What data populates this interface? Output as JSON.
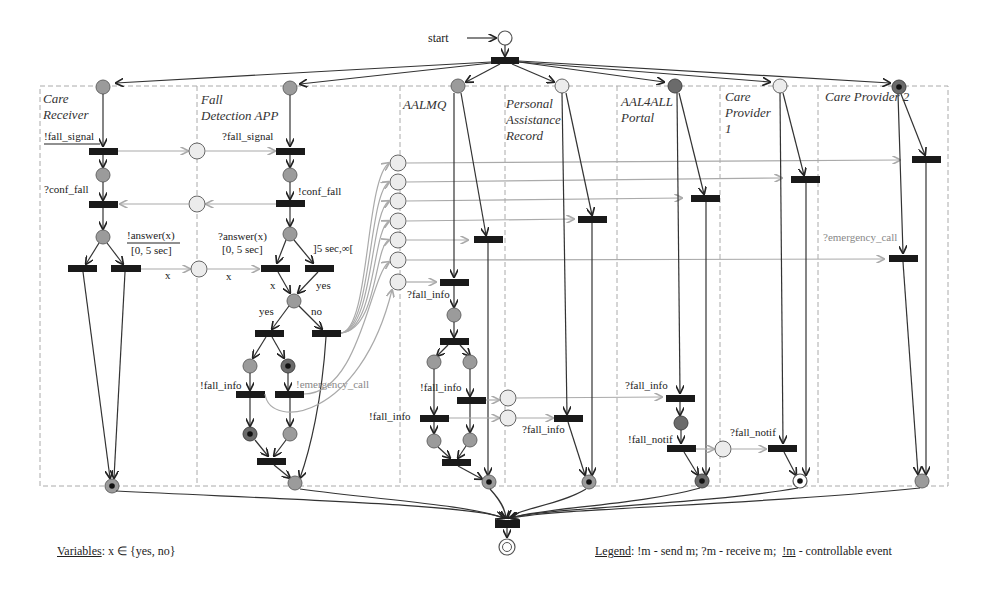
{
  "start_label": "start",
  "lanes": [
    {
      "title_lines": [
        "Care",
        "Receiver"
      ],
      "x": 40,
      "w": 157
    },
    {
      "title_lines": [
        "Fall",
        "Detection APP"
      ],
      "x": 197,
      "w": 203
    },
    {
      "title_lines": [
        "AALMQ"
      ],
      "x": 400,
      "w": 105
    },
    {
      "title_lines": [
        "Personal",
        "Assistance",
        "Record"
      ],
      "x": 505,
      "w": 112
    },
    {
      "title_lines": [
        "AAL4ALL",
        "Portal"
      ],
      "x": 617,
      "w": 103
    },
    {
      "title_lines": [
        "Care",
        "Provider",
        "1"
      ],
      "x": 720,
      "w": 98
    },
    {
      "title_lines": [
        "Care Provider 2"
      ],
      "x": 818,
      "w": 130
    }
  ],
  "labels": {
    "fall_signal_send": "!fall_signal",
    "fall_signal_recv": "?fall_signal",
    "conf_fall_recv": "?conf_fall",
    "conf_fall_send": "!conf_fall",
    "answer_send": "!answer(x)",
    "answer_send_interval": "[0, 5 sec]",
    "answer_recv": "?answer(x)",
    "answer_recv_interval": "[0, 5 sec]",
    "timeout_interval": "]5 sec,∞[",
    "x1": "x",
    "x2": "x",
    "x3": "x",
    "yes1": "yes",
    "yes2": "yes",
    "no1": "no",
    "fd_fall_info": "!fall_info",
    "fd_emergency": "!emergency_call",
    "mq_fall_info_recv": "?fall_info",
    "mq_fall_info_send1": "!fall_info",
    "mq_fall_info_send2": "!fall_info",
    "par_fall_info_recv": "?fall_info",
    "portal_fall_info_recv": "?fall_info",
    "portal_fall_notif_send": "!fall_notif",
    "cp1_fall_notif_recv": "?fall_notif",
    "cp2_emergency_recv": "?emergency_call"
  },
  "footer": {
    "variables_label": "Variables",
    "variables_text": ": x ∈ {yes, no}",
    "legend_label": "Legend",
    "legend_send": ":  !m - send m;",
    "legend_receive": "  ?m - receive m;",
    "legend_controllable_m": "!m",
    "legend_controllable_text": " - controllable event"
  },
  "colors": {
    "transition": "#1a1a1a",
    "place_gray": "#9b9b9b",
    "place_light": "#ececec",
    "message_arc": "#aaaaaa",
    "lane_border": "#aaaaaa"
  }
}
